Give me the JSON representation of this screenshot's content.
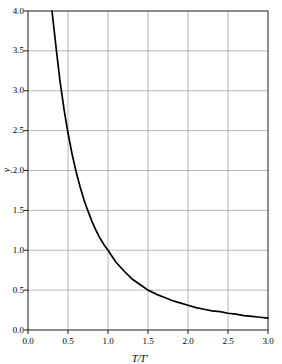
{
  "chart_data": {
    "type": "line",
    "title": "",
    "xlabel": "T/T′",
    "ylabel": "y",
    "xlim": [
      0.0,
      3.0
    ],
    "ylim": [
      0.0,
      4.0
    ],
    "grid": true,
    "legend": "none",
    "xticks": [
      "0.0",
      "0.5",
      "1.0",
      "1.5",
      "2.0",
      "2.5",
      "3.0"
    ],
    "xtick_values": [
      0.0,
      0.5,
      1.0,
      1.5,
      2.0,
      2.5,
      3.0
    ],
    "yticks": [
      "0.0",
      "0.5",
      "1.0",
      "1.5",
      "2.0",
      "2.5",
      "3.0",
      "3.5",
      "4.0"
    ],
    "ytick_values": [
      0.0,
      0.5,
      1.0,
      1.5,
      2.0,
      2.5,
      3.0,
      3.5,
      4.0
    ],
    "series": [
      {
        "name": "curve",
        "color": "#000000",
        "x": [
          0.3,
          0.35,
          0.4,
          0.45,
          0.5,
          0.55,
          0.6,
          0.65,
          0.7,
          0.75,
          0.8,
          0.85,
          0.9,
          0.95,
          1.0,
          1.1,
          1.2,
          1.3,
          1.4,
          1.5,
          1.6,
          1.7,
          1.8,
          1.9,
          2.0,
          2.1,
          2.2,
          2.3,
          2.4,
          2.5,
          2.6,
          2.7,
          2.8,
          2.9,
          3.0
        ],
        "y": [
          4.0,
          3.55,
          3.12,
          2.77,
          2.47,
          2.21,
          1.99,
          1.8,
          1.63,
          1.49,
          1.36,
          1.25,
          1.15,
          1.07,
          1.0,
          0.85,
          0.74,
          0.64,
          0.57,
          0.5,
          0.45,
          0.41,
          0.37,
          0.34,
          0.31,
          0.28,
          0.26,
          0.24,
          0.23,
          0.21,
          0.2,
          0.18,
          0.17,
          0.16,
          0.15
        ]
      }
    ],
    "axis_color": "#1a1a1a",
    "grid_color": "#9a9a9a",
    "background": "#ffffff"
  },
  "geometry": {
    "plot_left": 28,
    "plot_right": 268,
    "plot_top": 11,
    "plot_bottom": 330
  }
}
